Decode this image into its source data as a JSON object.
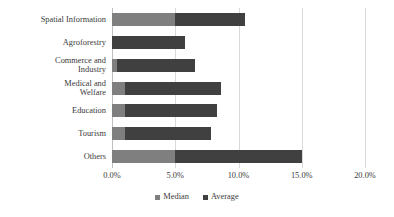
{
  "chart_data": {
    "type": "bar",
    "orientation": "horizontal",
    "stacked": true,
    "title": "",
    "xlabel": "",
    "ylabel": "",
    "xlim": [
      0,
      20
    ],
    "xticks": [
      0,
      5,
      10,
      15,
      20
    ],
    "xtick_labels": [
      "0.0%",
      "5.0%",
      "10.0%",
      "15.0%",
      "20.0%"
    ],
    "grid": true,
    "legend_position": "bottom",
    "categories": [
      "Spatial Information",
      "Agroforestry",
      "Commerce and\nIndustry",
      "Medical and\nWelfare",
      "Education",
      "Tourism",
      "Others"
    ],
    "series": [
      {
        "name": "Median",
        "color": "#7f7f7f",
        "values": [
          5.0,
          0.0,
          0.4,
          1.0,
          1.0,
          1.0,
          5.0
        ]
      },
      {
        "name": "Average",
        "color": "#404040",
        "values": [
          5.5,
          5.8,
          6.2,
          7.6,
          7.3,
          6.8,
          10.0
        ]
      }
    ],
    "totals": [
      10.5,
      5.8,
      6.6,
      8.6,
      8.3,
      7.8,
      15.0
    ]
  },
  "legend": {
    "items": [
      {
        "label": "Median"
      },
      {
        "label": "Average"
      }
    ]
  },
  "colors": {
    "median": "#7f7f7f",
    "average": "#404040",
    "gridline": "#d9d9d9",
    "text": "#3a3a3a",
    "background": "#ffffff"
  }
}
